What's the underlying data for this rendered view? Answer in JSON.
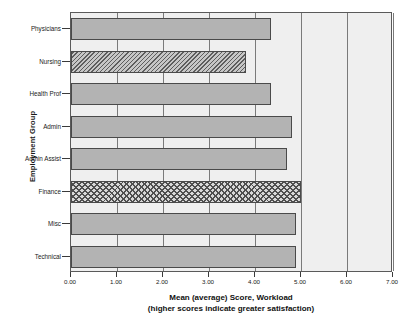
{
  "chart_data": {
    "type": "bar",
    "orientation": "horizontal",
    "title": "",
    "xlabel": "Mean (average) Score, Workload",
    "xlabel_line2": "(higher scores indicate greater satisfaction)",
    "ylabel": "Employment Group",
    "xlim": [
      0.0,
      7.0
    ],
    "xticks": [
      "0.00",
      "1.00",
      "2.00",
      "3.00",
      "4.00",
      "5.00",
      "6.00",
      "7.00"
    ],
    "xtick_values": [
      0.0,
      1.0,
      2.0,
      3.0,
      4.0,
      5.0,
      6.0,
      7.0
    ],
    "grid": true,
    "legend": "none",
    "categories": [
      "Physicians",
      "Nursing",
      "Health Prof",
      "Admin",
      "Admin Assist",
      "Finance",
      "Misc",
      "Technical"
    ],
    "values": [
      4.35,
      3.8,
      4.35,
      4.8,
      4.7,
      5.0,
      4.9,
      4.9
    ],
    "bars": [
      {
        "label": "Physicians",
        "value": 4.35,
        "pattern": "solid"
      },
      {
        "label": "Nursing",
        "value": 3.8,
        "pattern": "diagonal-hatch"
      },
      {
        "label": "Health Prof",
        "value": 4.35,
        "pattern": "solid"
      },
      {
        "label": "Admin",
        "value": 4.8,
        "pattern": "solid"
      },
      {
        "label": "Admin Assist",
        "value": 4.7,
        "pattern": "solid"
      },
      {
        "label": "Finance",
        "value": 5.0,
        "pattern": "checkerboard"
      },
      {
        "label": "Misc",
        "value": 4.9,
        "pattern": "solid"
      },
      {
        "label": "Technical",
        "value": 4.9,
        "pattern": "solid"
      }
    ],
    "colors": {
      "bar_fill": "#b3b3b3",
      "bar_border": "#4a4a4a",
      "plot_background": "#efefef",
      "gridline": "#7a7a7a",
      "axis": "#5a5a5a",
      "text": "#1a1a1a"
    }
  }
}
